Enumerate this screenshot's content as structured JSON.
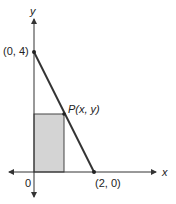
{
  "diagram": {
    "axes": {
      "x_label": "x",
      "y_label": "y",
      "origin_label": "0"
    },
    "points": {
      "y_intercept": {
        "label": "(0, 4)",
        "x": 0,
        "y": 4
      },
      "x_intercept": {
        "label": "(2, 0)",
        "x": 2,
        "y": 0
      },
      "p": {
        "label": "P(x, y)",
        "name": "P",
        "coords": "(x, y)"
      }
    },
    "line": {
      "equation": "y = 4 - 2x"
    },
    "rectangle": {
      "fill": "#d4d4d4",
      "stroke": "#333333"
    },
    "colors": {
      "line": "#333333",
      "axis": "#333333"
    }
  }
}
